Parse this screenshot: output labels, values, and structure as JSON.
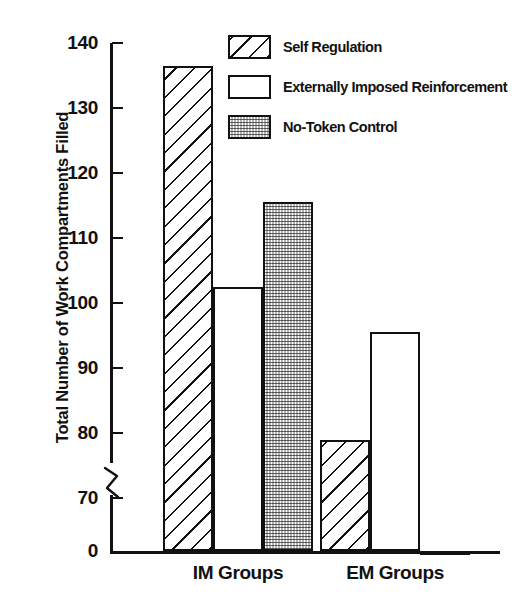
{
  "chart_data": {
    "type": "bar",
    "title": "",
    "xlabel": "",
    "ylabel": "Total Number of Work Compartments Filled",
    "categories": [
      "IM Groups",
      "EM Groups"
    ],
    "series": [
      {
        "name": "Self Regulation",
        "pattern": "hatch",
        "values": [
          136.5,
          79
        ]
      },
      {
        "name": "Externally Imposed Reinforcement",
        "pattern": "open",
        "values": [
          102.5,
          95.5
        ]
      },
      {
        "name": "No-Token Control",
        "pattern": "stipple",
        "values": [
          115.5,
          67
        ]
      }
    ],
    "ylim": [
      0,
      140
    ],
    "y_axis_break": true,
    "y_break_between": [
      0,
      70
    ],
    "yticks": [
      140,
      130,
      120,
      110,
      100,
      90,
      80,
      70,
      0
    ],
    "ytick_labels": [
      "140",
      "130",
      "120",
      "110",
      "100",
      "90",
      "80",
      "70",
      "0"
    ],
    "grid": false,
    "legend_position": "top-right",
    "colors": {
      "ink": "#111111",
      "background": "#ffffff"
    }
  },
  "axis": {
    "y_title": "Total Number of Work Compartments Filled",
    "ticks": [
      {
        "label": "140",
        "value": 140
      },
      {
        "label": "130",
        "value": 130
      },
      {
        "label": "120",
        "value": 120
      },
      {
        "label": "110",
        "value": 110
      },
      {
        "label": "100",
        "value": 100
      },
      {
        "label": "90",
        "value": 90
      },
      {
        "label": "80",
        "value": 80
      },
      {
        "label": "70",
        "value": 70
      },
      {
        "label": "0",
        "value": 0
      }
    ],
    "group_labels": [
      "IM Groups",
      "EM Groups"
    ]
  },
  "legend": {
    "items": [
      {
        "label": "Self Regulation",
        "pattern": "hatch"
      },
      {
        "label": "Externally Imposed Reinforcement",
        "pattern": "open"
      },
      {
        "label": "No-Token Control",
        "pattern": "stipple"
      }
    ]
  }
}
